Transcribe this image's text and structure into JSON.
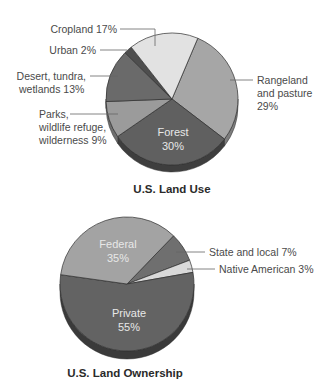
{
  "chart_data": [
    {
      "type": "pie",
      "title": "U.S. Land Use",
      "center": [
        172,
        99
      ],
      "radius": 66,
      "depth": 7,
      "start_angle": -67,
      "slices": [
        {
          "label": "Rangeland and pasture",
          "label_lines": [
            "Rangeland",
            "and pasture",
            "29%"
          ],
          "value": 29,
          "color": "#a6a6a6",
          "side": "#7d7d7d"
        },
        {
          "label": "Forest",
          "label_lines": [
            "Forest",
            "30%"
          ],
          "value": 30,
          "color": "#606060",
          "side": "#3e3e3e",
          "inside": true
        },
        {
          "label": "Parks, wildlife refuge, wilderness",
          "label_lines": [
            "Parks,",
            "wildlife refuge,",
            "wilderness 9%"
          ],
          "value": 9,
          "color": "#9b9b9b",
          "side": "#6e6e6e"
        },
        {
          "label": "Desert, tundra, wetlands",
          "label_lines": [
            "Desert, tundra,",
            "wetlands 13%"
          ],
          "value": 13,
          "color": "#6a6a6a",
          "side": "#4a4a4a"
        },
        {
          "label": "Urban",
          "label_lines": [
            "Urban 2%"
          ],
          "value": 2,
          "color": "#4e4e4e",
          "side": "#333333"
        },
        {
          "label": "Cropland",
          "label_lines": [
            "Cropland 17%"
          ],
          "value": 17,
          "color": "#e2e2e2",
          "side": "#bcbcbc"
        }
      ]
    },
    {
      "type": "pie",
      "title": "U.S. Land Ownership",
      "center": [
        127,
        284
      ],
      "radius": 67,
      "depth": 8,
      "start_angle": -46,
      "slices": [
        {
          "label": "State and local",
          "label_lines": [
            "State and local 7%"
          ],
          "value": 7,
          "color": "#6f6f6f",
          "side": "#4c4c4c"
        },
        {
          "label": "Native American",
          "label_lines": [
            "Native American 3%"
          ],
          "value": 3,
          "color": "#d9d9d9",
          "side": "#b0b0b0"
        },
        {
          "label": "Private",
          "label_lines": [
            "Private",
            "55%"
          ],
          "value": 55,
          "color": "#636363",
          "side": "#3a3a3a",
          "inside": true
        },
        {
          "label": "Federal",
          "label_lines": [
            "Federal",
            "35%"
          ],
          "value": 35,
          "color": "#a3a3a3",
          "side": "#7a7a7a",
          "inside": true
        }
      ]
    }
  ]
}
